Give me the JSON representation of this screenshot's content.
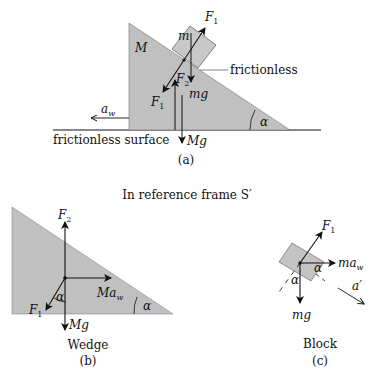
{
  "figure_a": {
    "caption": "(a)",
    "labels": {
      "M": "M",
      "m": "m",
      "F1_top": "F",
      "F1_top_sub": "1",
      "F1_bottom": "F",
      "F1_bottom_sub": "1",
      "F2": "F",
      "F2_sub": "2",
      "mg": "mg",
      "Mg": "Mg",
      "aw": "a",
      "aw_sub": "w",
      "alpha": "α",
      "frictionless": "frictionless",
      "surface": "frictionless surface"
    }
  },
  "frame_title": "In reference frame S′",
  "figure_b": {
    "name": "Wedge",
    "caption": "(b)",
    "labels": {
      "F2": "F",
      "F2_sub": "2",
      "F1": "F",
      "F1_sub": "1",
      "Maw": "Ma",
      "Maw_sub": "w",
      "Mg": "Mg",
      "alpha_inner": "α",
      "alpha_corner": "α"
    }
  },
  "figure_c": {
    "name": "Block",
    "caption": "(c)",
    "labels": {
      "F1": "F",
      "F1_sub": "1",
      "maw": "ma",
      "maw_sub": "w",
      "mg": "mg",
      "alpha1": "α",
      "alpha2": "α",
      "a_prime": "a′"
    }
  },
  "colors": {
    "fill": "#c0c0c0",
    "stroke": "#111111"
  }
}
